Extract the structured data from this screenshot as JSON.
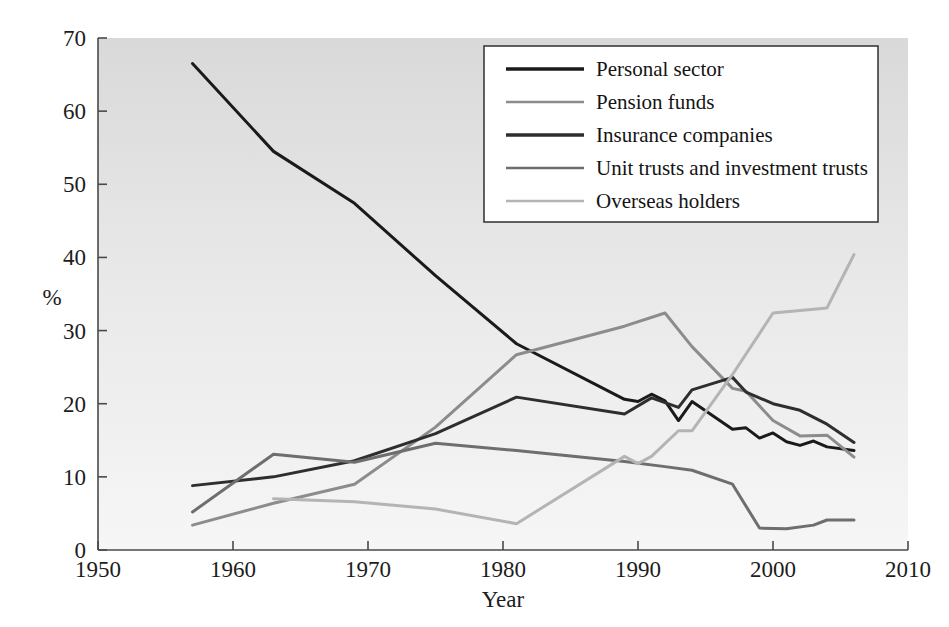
{
  "chart_data": {
    "type": "line",
    "title": "",
    "xlabel": "Year",
    "ylabel": "%",
    "xlim": [
      1950,
      2010
    ],
    "ylim": [
      0,
      70
    ],
    "xticks": [
      1950,
      1960,
      1970,
      1980,
      1990,
      2000,
      2010
    ],
    "yticks": [
      0,
      10,
      20,
      30,
      40,
      50,
      60,
      70
    ],
    "xtick_labels": [
      "1950",
      "1960",
      "1970",
      "1980",
      "1990",
      "2000",
      "2010"
    ],
    "ytick_labels": [
      "0",
      "10",
      "20",
      "30",
      "40",
      "50",
      "60",
      "70"
    ],
    "grid": false,
    "legend_position": "top-right",
    "background": "#e4e4e4",
    "series": [
      {
        "name": "Personal sector",
        "color": "#1a1a1a",
        "width": 3.0,
        "x": [
          1957,
          1963,
          1969,
          1975,
          1981,
          1989,
          1990,
          1991,
          1992,
          1993,
          1994,
          1997,
          1998,
          1999,
          2000,
          2001,
          2002,
          2003,
          2004,
          2006
        ],
        "y": [
          66.5,
          54.5,
          47.4,
          37.5,
          28.2,
          20.6,
          20.3,
          21.3,
          20.4,
          17.7,
          20.3,
          16.5,
          16.7,
          15.3,
          16.0,
          14.8,
          14.3,
          14.9,
          14.1,
          13.6
        ]
      },
      {
        "name": "Pension funds",
        "color": "#8c8c8c",
        "width": 3.0,
        "x": [
          1957,
          1963,
          1969,
          1975,
          1981,
          1989,
          1992,
          1994,
          1997,
          1998,
          2000,
          2002,
          2004,
          2006
        ],
        "y": [
          3.4,
          6.4,
          9.0,
          16.8,
          26.7,
          30.6,
          32.4,
          27.8,
          22.1,
          21.7,
          17.7,
          15.6,
          15.7,
          12.7
        ]
      },
      {
        "name": "Insurance companies",
        "color": "#2e2e2e",
        "width": 3.0,
        "x": [
          1957,
          1963,
          1969,
          1975,
          1981,
          1989,
          1991,
          1993,
          1994,
          1997,
          1998,
          2000,
          2002,
          2004,
          2006
        ],
        "y": [
          8.8,
          10.0,
          12.2,
          15.9,
          20.9,
          18.6,
          20.8,
          19.5,
          21.9,
          23.6,
          21.6,
          20.0,
          19.1,
          17.2,
          14.7
        ]
      },
      {
        "name": "Unit trusts and investment trusts",
        "color": "#6e6e6e",
        "width": 3.0,
        "x": [
          1957,
          1963,
          1969,
          1975,
          1981,
          1989,
          1992,
          1994,
          1997,
          1999,
          2001,
          2003,
          2004,
          2006
        ],
        "y": [
          5.2,
          13.1,
          12.0,
          14.6,
          13.6,
          12.1,
          11.4,
          10.9,
          9.0,
          3.0,
          2.9,
          3.4,
          4.1,
          4.1
        ]
      },
      {
        "name": "Overseas holders",
        "color": "#b4b4b4",
        "width": 3.0,
        "x": [
          1963,
          1969,
          1975,
          1981,
          1989,
          1990,
          1991,
          1993,
          1994,
          1997,
          2000,
          2004,
          2006
        ],
        "y": [
          7.0,
          6.6,
          5.6,
          3.6,
          12.8,
          11.8,
          12.8,
          16.3,
          16.3,
          24.0,
          32.4,
          33.1,
          40.4
        ]
      }
    ]
  },
  "axes": {
    "ylabel": "%",
    "xlabel": "Year"
  },
  "legend": {
    "items": [
      {
        "label": "Personal sector",
        "color": "#1a1a1a"
      },
      {
        "label": "Pension funds",
        "color": "#8c8c8c"
      },
      {
        "label": "Insurance companies",
        "color": "#2e2e2e"
      },
      {
        "label": "Unit trusts and investment trusts",
        "color": "#6e6e6e"
      },
      {
        "label": "Overseas holders",
        "color": "#b4b4b4"
      }
    ]
  }
}
